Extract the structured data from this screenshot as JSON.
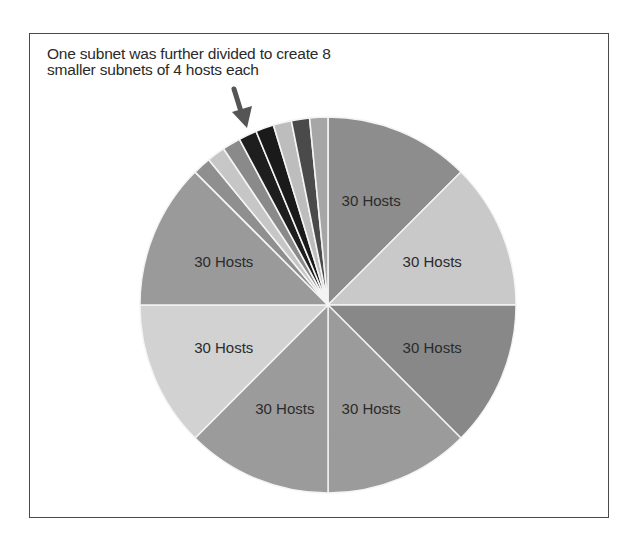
{
  "chart_data": {
    "type": "pie",
    "title": "",
    "annotation": {
      "lines": [
        "One subnet was further divided to create 8",
        "smaller subnets of 4 hosts each"
      ],
      "arrow": "points to the small subdivided slices"
    },
    "slices": [
      {
        "label": "30 Hosts",
        "value": 45,
        "hosts": 30,
        "color": "#8d8d8d"
      },
      {
        "label": "30 Hosts",
        "value": 45,
        "hosts": 30,
        "color": "#c9c9c9"
      },
      {
        "label": "30 Hosts",
        "value": 45,
        "hosts": 30,
        "color": "#888888"
      },
      {
        "label": "30 Hosts",
        "value": 45,
        "hosts": 30,
        "color": "#9b9b9b"
      },
      {
        "label": "30 Hosts",
        "value": 45,
        "hosts": 30,
        "color": "#9b9b9b"
      },
      {
        "label": "30 Hosts",
        "value": 45,
        "hosts": 30,
        "color": "#d2d2d2"
      },
      {
        "label": "30 Hosts",
        "value": 45,
        "hosts": 30,
        "color": "#9a9a9a"
      },
      {
        "label": "",
        "value": 5.625,
        "hosts": 4,
        "color": "#8f8f8f"
      },
      {
        "label": "",
        "value": 5.625,
        "hosts": 4,
        "color": "#c6c6c6"
      },
      {
        "label": "",
        "value": 5.625,
        "hosts": 4,
        "color": "#8a8a8a"
      },
      {
        "label": "",
        "value": 5.625,
        "hosts": 4,
        "color": "#1e1e1e"
      },
      {
        "label": "",
        "value": 5.625,
        "hosts": 4,
        "color": "#1a1a1a"
      },
      {
        "label": "",
        "value": 5.625,
        "hosts": 4,
        "color": "#bdbdbd"
      },
      {
        "label": "",
        "value": 5.625,
        "hosts": 4,
        "color": "#4a4a4a"
      },
      {
        "label": "",
        "value": 5.625,
        "hosts": 4,
        "color": "#a6a6a6"
      }
    ],
    "legend": "none",
    "start_angle": "12 o'clock, clockwise"
  },
  "labels": {
    "annotation_line1": "One subnet was further divided to create 8",
    "annotation_line2": "smaller subnets of 4 hosts each"
  }
}
